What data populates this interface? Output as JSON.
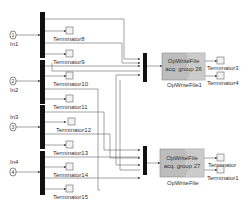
{
  "diagram": {
    "inports": [
      {
        "id": "in1",
        "label": "In1",
        "number": "1"
      },
      {
        "id": "in2",
        "label": "In2",
        "number": "2"
      },
      {
        "id": "in3",
        "label": "In3",
        "number": "3"
      },
      {
        "id": "in4",
        "label": "In4",
        "number": "4"
      }
    ],
    "terminators_left": [
      {
        "label": "Terminator8"
      },
      {
        "label": "Terminator9"
      },
      {
        "label": "Terminator10"
      },
      {
        "label": "Terminator11"
      },
      {
        "label": "Terminator12"
      },
      {
        "label": "Terminator13"
      },
      {
        "label": "Terminator14"
      },
      {
        "label": "Terminator15"
      }
    ],
    "opwritefile_blocks": [
      {
        "line1": "OpWriteFile",
        "line2": "acq. group 26",
        "name": "OpWriteFile1",
        "terminators": [
          "Terminator3",
          "Terminator4"
        ]
      },
      {
        "line1": "OpWriteFile",
        "line2": "acq. group 27",
        "name": "OpWriteFile",
        "terminators": [
          "Terminator",
          "Terminator1"
        ]
      }
    ],
    "colors": {
      "line": "#555555",
      "bar": "#111111",
      "block_fill": "#bdbdbd",
      "block_border": "#888888"
    }
  }
}
